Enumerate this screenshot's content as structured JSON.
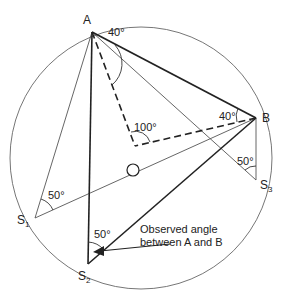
{
  "diagram": {
    "points": {
      "A": {
        "label": "A"
      },
      "B": {
        "label": "B"
      },
      "S1": {
        "label": "S",
        "sub": "1"
      },
      "S2": {
        "label": "S",
        "sub": "2"
      },
      "S3": {
        "label": "S",
        "sub": "3"
      },
      "O": {
        "label": "O"
      }
    },
    "angles": {
      "at_A": "40°",
      "at_B": "40°",
      "at_O": "100°",
      "at_S1": "50°",
      "at_S2": "50°",
      "at_S3": "50°"
    },
    "annotation": {
      "line1": "Observed angle",
      "line2": "between A and B"
    },
    "colors": {
      "stroke": "#222222",
      "thin": "#555555",
      "background": "#ffffff"
    }
  }
}
